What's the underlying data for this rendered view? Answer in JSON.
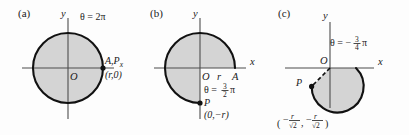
{
  "figure": {
    "background_color": "#fdfdfd",
    "shade_color": "#d4d4d4",
    "curve_color": "#111111",
    "axis_color": "#4d4d4d"
  },
  "panels": [
    {
      "id": "a",
      "label": "(a)",
      "axis_y": "y",
      "axis_x": "",
      "origin_label": "O",
      "theta_text": "θ = 2π",
      "point_label": "A,P",
      "point_sub": "x",
      "point_coord": "(r,0)",
      "sweep_start_deg": 0,
      "sweep_end_deg": 360,
      "center": [
        68,
        68
      ],
      "radius": 35,
      "shaded": true
    },
    {
      "id": "b",
      "label": "(b)",
      "axis_y": "y",
      "axis_x": "x",
      "origin_label": "O",
      "radius_label": "r",
      "point_a_label": "A",
      "theta_prefix": "θ =",
      "theta_num": "3",
      "theta_den": "2",
      "theta_suffix": "π",
      "point_label": "P",
      "point_coord": "(0,−r)",
      "sweep_start_deg": 0,
      "sweep_end_deg": 270,
      "center": [
        200,
        68
      ],
      "radius": 35,
      "shaded": true
    },
    {
      "id": "c",
      "label": "(c)",
      "axis_y": "y",
      "axis_x": "x",
      "origin_label": "O",
      "theta_prefix": "θ = −",
      "theta_num": "3",
      "theta_den": "4",
      "theta_suffix": "π",
      "point_label": "P",
      "coord_open": "(",
      "coord_close": ")",
      "coord_x_sign": "−",
      "coord_x_num": "r",
      "coord_x_den": "√2",
      "coord_comma": ",",
      "coord_y_sign": "−",
      "coord_y_num": "r",
      "coord_y_den": "√2",
      "sweep_start_deg": 0,
      "sweep_end_deg": -225,
      "center": [
        330,
        68
      ],
      "radius": 26,
      "shaded": true
    }
  ]
}
